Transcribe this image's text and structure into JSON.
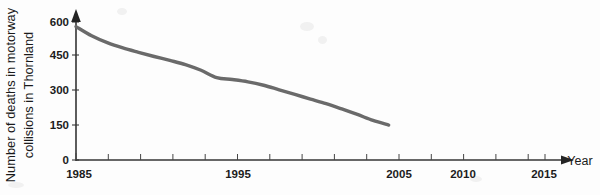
{
  "figure": {
    "background_color": "#fdfdfd",
    "curve_color": "#6a6a6a",
    "axis_color": "#343434"
  },
  "chart_data": {
    "type": "line",
    "title": "",
    "xlabel": "Year",
    "ylabel": "Number of deaths in motorway collisions in Thornland",
    "ylabel_line1": "Number of deaths in motorway",
    "ylabel_line2": "collisions in Thornland",
    "xlim": [
      1985,
      2016
    ],
    "ylim": [
      0,
      640
    ],
    "grid": false,
    "legend": null,
    "x_tick_labels": [
      "1985",
      "1995",
      "2005",
      "2010",
      "2015"
    ],
    "x_tick_values": [
      1985,
      1995,
      2005,
      2010,
      2015
    ],
    "x_minor_tick_step": 2,
    "y_tick_labels": [
      "0",
      "150",
      "300",
      "450",
      "600"
    ],
    "y_tick_values": [
      0,
      150,
      300,
      450,
      600
    ],
    "x_axis_arrow": true,
    "y_axis_arrow": true,
    "series": [
      {
        "name": "Deaths in motorway collisions",
        "color": "#6a6a6a",
        "x": [
          1985,
          1986,
          1987,
          1988,
          1989,
          1990,
          1991,
          1992,
          1993,
          1994,
          1995,
          1996,
          1997,
          1998,
          1999,
          2000,
          2001,
          2002,
          2003,
          2004,
          2005
        ],
        "values": [
          580,
          540,
          510,
          487,
          468,
          450,
          433,
          415,
          390,
          358,
          350,
          340,
          325,
          305,
          285,
          265,
          245,
          222,
          198,
          172,
          152
        ]
      }
    ],
    "annotations": []
  },
  "axis": {
    "year_label": "Year"
  }
}
